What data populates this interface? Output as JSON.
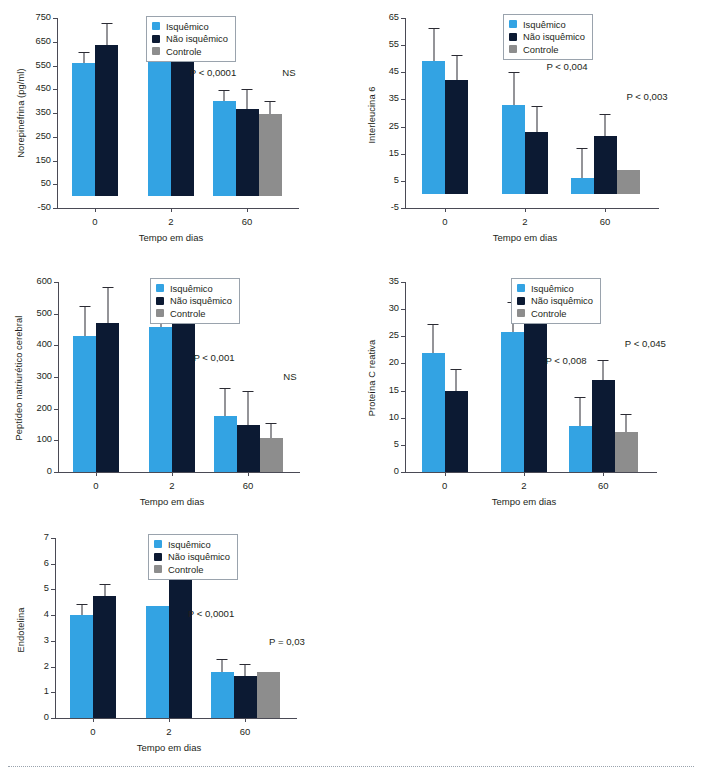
{
  "legend": {
    "items": [
      {
        "key": "isq",
        "label": "Isquêmico",
        "color": "#33A3E3"
      },
      {
        "key": "nao",
        "label": "Não isquêmico",
        "color": "#0C1A33"
      },
      {
        "key": "ctl",
        "label": "Controle",
        "color": "#8D8D8D"
      }
    ]
  },
  "common": {
    "xlabel": "Tempo em dias",
    "categories": [
      "0",
      "2",
      "60"
    ]
  },
  "chart_data": [
    {
      "id": "norepinefrina",
      "type": "bar",
      "title": "",
      "ylabel": "Norepinefrina (pg/ml)",
      "xlabel": "Tempo em dias",
      "categories": [
        "0",
        "2",
        "60"
      ],
      "yticks": [
        "-50",
        "50",
        "150",
        "250",
        "350",
        "450",
        "550",
        "650",
        "750"
      ],
      "ylim": [
        -50,
        750
      ],
      "grid": false,
      "legend_position": "top-right",
      "series": [
        {
          "name": "Isquêmico",
          "color": "#33A3E3",
          "values": [
            560,
            610,
            400
          ],
          "errors": [
            45,
            35,
            45
          ]
        },
        {
          "name": "Não isquêmico",
          "color": "#0C1A33",
          "values": [
            635,
            635,
            368
          ],
          "errors": [
            95,
            85,
            82
          ]
        },
        {
          "name": "Controle",
          "color": "#8D8D8D",
          "values": [
            null,
            null,
            345
          ],
          "errors": [
            null,
            null,
            55
          ]
        }
      ],
      "annotations": [
        {
          "text": "P < 0,0001",
          "category": "2",
          "value": 520
        },
        {
          "text": "NS",
          "category": "60",
          "value": 520
        }
      ]
    },
    {
      "id": "interleucina",
      "type": "bar",
      "title": "",
      "ylabel": "Interleucina 6",
      "xlabel": "Tempo em dias",
      "categories": [
        "0",
        "2",
        "60"
      ],
      "yticks": [
        "-5",
        "5",
        "15",
        "25",
        "35",
        "45",
        "55",
        "65"
      ],
      "ylim": [
        -5,
        65
      ],
      "grid": false,
      "legend_position": "top-right",
      "series": [
        {
          "name": "Isquêmico",
          "color": "#33A3E3",
          "values": [
            49,
            33,
            6
          ],
          "errors": [
            12.5,
            12,
            11
          ]
        },
        {
          "name": "Não isquêmico",
          "color": "#0C1A33",
          "values": [
            42,
            23,
            21.5
          ],
          "errors": [
            9.5,
            9.5,
            8
          ]
        },
        {
          "name": "Controle",
          "color": "#8D8D8D",
          "values": [
            null,
            null,
            9
          ],
          "errors": [
            null,
            null,
            0
          ]
        }
      ],
      "annotations": [
        {
          "text": "P < 0,004",
          "category": "2",
          "value": 47
        },
        {
          "text": "P < 0,003",
          "category": "60",
          "value": 36
        }
      ]
    },
    {
      "id": "peptideo",
      "type": "bar",
      "title": "",
      "ylabel": "Peptídeo natriurético cerebral",
      "xlabel": "Tempo em dias",
      "categories": [
        "0",
        "2",
        "60"
      ],
      "yticks": [
        "0",
        "100",
        "200",
        "300",
        "400",
        "500",
        "600"
      ],
      "ylim": [
        0,
        600
      ],
      "grid": false,
      "legend_position": "top-right",
      "series": [
        {
          "name": "Isquêmico",
          "color": "#33A3E3",
          "values": [
            430,
            458,
            177
          ],
          "errors": [
            93,
            85,
            88
          ]
        },
        {
          "name": "Não isquêmico",
          "color": "#0C1A33",
          "values": [
            470,
            472,
            147
          ],
          "errors": [
            113,
            122,
            110
          ]
        },
        {
          "name": "Controle",
          "color": "#8D8D8D",
          "values": [
            null,
            null,
            107
          ],
          "errors": [
            null,
            null,
            48
          ]
        }
      ],
      "annotations": [
        {
          "text": "P < 0,001",
          "category": "2",
          "value": 360
        },
        {
          "text": "NS",
          "category": "60",
          "value": 300
        }
      ]
    },
    {
      "id": "proteina",
      "type": "bar",
      "title": "",
      "ylabel": "Proteína C reativa",
      "xlabel": "Tempo em dias",
      "categories": [
        "0",
        "2",
        "60"
      ],
      "yticks": [
        "0",
        "5",
        "10",
        "15",
        "20",
        "25",
        "30",
        "35"
      ],
      "ylim": [
        0,
        35
      ],
      "grid": false,
      "legend_position": "top-right",
      "series": [
        {
          "name": "Isquêmico",
          "color": "#33A3E3",
          "values": [
            22,
            25.8,
            8.5
          ],
          "errors": [
            5.3,
            5.6,
            5.3
          ]
        },
        {
          "name": "Não isquêmico",
          "color": "#0C1A33",
          "values": [
            15,
            27.3,
            17
          ],
          "errors": [
            3.9,
            3.7,
            3.7
          ]
        },
        {
          "name": "Controle",
          "color": "#8D8D8D",
          "values": [
            null,
            null,
            7.3
          ],
          "errors": [
            null,
            null,
            3.4
          ]
        }
      ],
      "annotations": [
        {
          "text": "P < 0,008",
          "category": "2",
          "value": 20.5
        },
        {
          "text": "P < 0,045",
          "category": "60",
          "value": 23.5
        }
      ]
    },
    {
      "id": "endotelina",
      "type": "bar",
      "title": "",
      "ylabel": "Endotelina",
      "xlabel": "Tempo em dias",
      "categories": [
        "0",
        "2",
        "60"
      ],
      "yticks": [
        "0",
        "1",
        "2",
        "3",
        "4",
        "5",
        "6",
        "7"
      ],
      "ylim": [
        0,
        7
      ],
      "grid": false,
      "legend_position": "top-right",
      "series": [
        {
          "name": "Isquêmico",
          "color": "#33A3E3",
          "values": [
            4.0,
            4.35,
            1.78
          ],
          "errors": [
            0.42,
            0,
            0.5
          ]
        },
        {
          "name": "Não isquêmico",
          "color": "#0C1A33",
          "values": [
            4.75,
            5.85,
            1.62
          ],
          "errors": [
            0.45,
            0.42,
            0.47
          ]
        },
        {
          "name": "Controle",
          "color": "#8D8D8D",
          "values": [
            null,
            null,
            1.77
          ],
          "errors": [
            null,
            null,
            0
          ]
        }
      ],
      "annotations": [
        {
          "text": "P < 0,0001",
          "category": "2",
          "value": 4.05
        },
        {
          "text": "P = 0,03",
          "category": "60",
          "value": 2.95
        }
      ]
    }
  ]
}
